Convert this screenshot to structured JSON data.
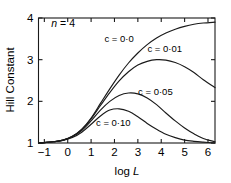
{
  "chart_data": {
    "type": "line",
    "title": "",
    "xlabel": "log L",
    "ylabel": "Hill Constant",
    "xlim": [
      -1.25,
      6.3
    ],
    "ylim": [
      1.0,
      4.0
    ],
    "grid": false,
    "legend_position": "inline-annotations",
    "x_ticks": [
      "-1",
      "0",
      "1",
      "2",
      "3",
      "4",
      "5",
      "6"
    ],
    "x_tick_values": [
      -1,
      0,
      1,
      2,
      3,
      4,
      5,
      6
    ],
    "y_ticks": [
      "1",
      "2",
      "3",
      "4"
    ],
    "y_tick_values": [
      1,
      2,
      3,
      4
    ],
    "annotations": [
      {
        "text_italic": "n",
        "text_plain": " = 4",
        "x": -0.7,
        "y": 3.78
      }
    ],
    "line_color": "#1a1a1a",
    "series": [
      {
        "name": "c = 0·0",
        "label": "c = 0·0",
        "label_x": 2.2,
        "label_y": 3.42,
        "x": [
          -1.25,
          -1.0,
          -0.6,
          -0.2,
          0.2,
          0.6,
          1.0,
          1.4,
          1.8,
          2.2,
          2.6,
          3.0,
          3.4,
          3.8,
          4.2,
          4.6,
          5.0,
          5.4,
          5.8,
          6.3
        ],
        "values": [
          1.0,
          1.01,
          1.03,
          1.07,
          1.16,
          1.33,
          1.6,
          1.95,
          2.3,
          2.63,
          2.92,
          3.16,
          3.36,
          3.52,
          3.64,
          3.73,
          3.8,
          3.85,
          3.88,
          3.9
        ]
      },
      {
        "name": "c = 0·01",
        "label": "c = 0·01",
        "label_x": 4.15,
        "label_y": 3.18,
        "x": [
          -1.25,
          -1.0,
          -0.6,
          -0.2,
          0.2,
          0.6,
          1.0,
          1.4,
          1.8,
          2.2,
          2.6,
          3.0,
          3.4,
          3.8,
          4.2,
          4.6,
          5.0,
          5.4,
          5.8,
          6.3
        ],
        "values": [
          1.0,
          1.01,
          1.03,
          1.07,
          1.16,
          1.32,
          1.58,
          1.9,
          2.21,
          2.49,
          2.71,
          2.87,
          2.96,
          3.0,
          2.99,
          2.93,
          2.83,
          2.69,
          2.52,
          2.33
        ]
      },
      {
        "name": "c = 0·05",
        "label": "c = 0·05",
        "label_x": 3.75,
        "label_y": 2.16,
        "x": [
          -1.25,
          -1.0,
          -0.6,
          -0.2,
          0.2,
          0.6,
          1.0,
          1.4,
          1.8,
          2.2,
          2.6,
          3.0,
          3.4,
          3.8,
          4.2,
          4.6,
          5.0,
          5.4,
          5.8,
          6.3
        ],
        "values": [
          1.0,
          1.01,
          1.03,
          1.07,
          1.15,
          1.3,
          1.53,
          1.79,
          2.0,
          2.14,
          2.2,
          2.18,
          2.08,
          1.92,
          1.72,
          1.53,
          1.36,
          1.22,
          1.11,
          1.03
        ]
      },
      {
        "name": "c = 0·10",
        "label": "c = 0·10",
        "label_x": 1.95,
        "label_y": 1.42,
        "x": [
          -1.25,
          -1.0,
          -0.6,
          -0.2,
          0.2,
          0.6,
          1.0,
          1.4,
          1.8,
          2.2,
          2.6,
          3.0,
          3.4,
          3.8,
          4.2,
          4.6,
          5.0,
          5.4,
          5.8,
          6.3
        ],
        "values": [
          1.0,
          1.01,
          1.03,
          1.06,
          1.13,
          1.26,
          1.45,
          1.65,
          1.79,
          1.82,
          1.76,
          1.63,
          1.47,
          1.33,
          1.21,
          1.13,
          1.07,
          1.04,
          1.02,
          1.0
        ]
      }
    ]
  }
}
